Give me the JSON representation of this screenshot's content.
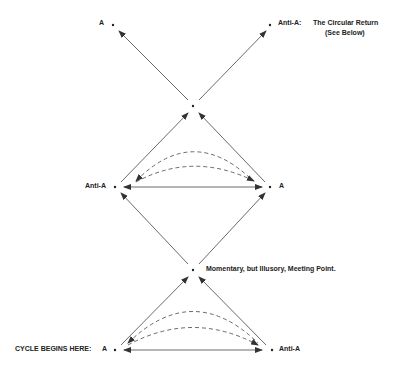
{
  "diagram": {
    "labels": {
      "top_left": "A",
      "top_right": "Anti-A:",
      "top_note_line1": "The Circular Return",
      "top_note_line2": "(See Below)",
      "mid_left": "Anti-A",
      "mid_right": "A",
      "meeting_point": "Momentary, but Illusory, Meeting Point.",
      "cycle_start": "CYCLE BEGINS HERE:",
      "bottom_left": "A",
      "bottom_right": "Anti-A"
    },
    "nodes": [
      {
        "id": "top-a",
        "x": 113,
        "y": 25
      },
      {
        "id": "top-anti-a",
        "x": 270,
        "y": 25
      },
      {
        "id": "upper-cross",
        "x": 193,
        "y": 106
      },
      {
        "id": "mid-anti-a",
        "x": 115,
        "y": 187
      },
      {
        "id": "mid-a",
        "x": 270,
        "y": 187
      },
      {
        "id": "meeting-point",
        "x": 193,
        "y": 270
      },
      {
        "id": "bottom-a",
        "x": 115,
        "y": 350
      },
      {
        "id": "bottom-anti-a",
        "x": 272,
        "y": 350
      }
    ],
    "colors": {
      "line": "#333333",
      "text": "#222222",
      "background": "#ffffff"
    }
  }
}
